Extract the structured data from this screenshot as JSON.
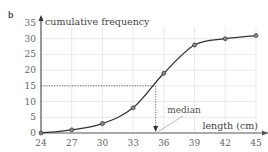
{
  "part_label": "b",
  "chart_data": {
    "type": "line",
    "title": "",
    "xlabel": "length (cm)",
    "ylabel": "cumulative frequency",
    "x": [
      24,
      27,
      30,
      33,
      36,
      39,
      42,
      45
    ],
    "series": [
      {
        "name": "cumulative frequency",
        "values": [
          0,
          1,
          3,
          8,
          19,
          28,
          30,
          31
        ]
      }
    ],
    "xticks": [
      24,
      27,
      30,
      33,
      36,
      39,
      42,
      45
    ],
    "yticks": [
      0,
      5,
      10,
      15,
      20,
      25,
      30,
      35
    ],
    "xlim": [
      24,
      45
    ],
    "ylim": [
      0,
      35
    ],
    "grid": true,
    "legend": "none",
    "annotations": [
      {
        "text": "median",
        "type": "arrow-label",
        "target_x": 35.2
      },
      {
        "type": "dashed-guide",
        "y": 15,
        "x": 35.2
      }
    ],
    "median_label": "median"
  }
}
